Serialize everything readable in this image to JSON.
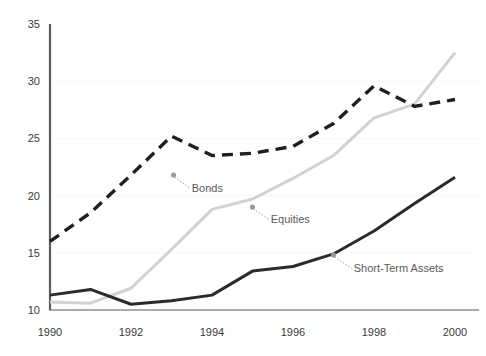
{
  "chart_data": {
    "type": "line",
    "title": "",
    "subtitle": "",
    "xlabel": "",
    "ylabel": "",
    "x": [
      1990,
      1991,
      1992,
      1993,
      1994,
      1995,
      1996,
      1997,
      1998,
      1999,
      2000
    ],
    "xlim": [
      1990,
      2000
    ],
    "ylim": [
      10,
      35
    ],
    "xticks": [
      1990,
      1992,
      1994,
      1996,
      1998,
      2000
    ],
    "xtick_labels": [
      "1990",
      "1992",
      "1994",
      "1996",
      "1998",
      "2000"
    ],
    "yticks": [
      10,
      15,
      20,
      25,
      30,
      35
    ],
    "ytick_labels": [
      "10",
      "15",
      "20",
      "25",
      "30",
      "35"
    ],
    "grid": "horizontal-dotted",
    "legend": "inline-annotations",
    "series": [
      {
        "name": "Bonds",
        "color": "#1f1f1f",
        "style": "dashed",
        "values": [
          16.0,
          18.5,
          21.8,
          25.2,
          23.5,
          23.7,
          24.3,
          26.3,
          29.6,
          27.8,
          28.4
        ],
        "annotation": {
          "label": "Bonds",
          "marker_x": 1993.05,
          "marker_y": 21.8,
          "label_x": 1993.5,
          "label_y": 20.3
        }
      },
      {
        "name": "Equities",
        "color": "#d2d2d2",
        "style": "solid",
        "values": [
          10.7,
          10.6,
          11.9,
          15.3,
          18.8,
          19.7,
          21.5,
          23.5,
          26.8,
          28.0,
          32.5
        ],
        "annotation": {
          "label": "Equities",
          "marker_x": 1995.0,
          "marker_y": 19.0,
          "label_x": 1995.45,
          "label_y": 17.6
        }
      },
      {
        "name": "Short-Term Assets",
        "color": "#2b2b2b",
        "style": "solid",
        "values": [
          11.3,
          11.8,
          10.5,
          10.8,
          11.3,
          13.4,
          13.8,
          14.9,
          16.9,
          19.3,
          21.6
        ],
        "annotation": {
          "label": "Short-Term Assets",
          "marker_x": 1997.0,
          "marker_y": 14.8,
          "label_x": 1997.5,
          "label_y": 13.3
        }
      }
    ],
    "colors": {
      "axis": "#5c5c5c",
      "grid": "#ececec",
      "text": "#3a3a3a",
      "annotation_text": "#5a5a5a",
      "leader": "#9a9a9a",
      "background": "#ffffff"
    }
  }
}
